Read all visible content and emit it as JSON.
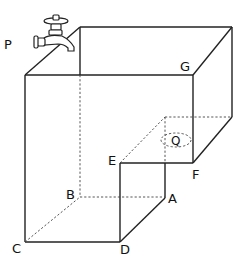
{
  "diagram": {
    "type": "3d-solid-water-tank",
    "colors": {
      "line": "#222222",
      "hidden_line": "#444444",
      "background": "#ffffff"
    },
    "labels": {
      "P": "P",
      "G": "G",
      "Q": "Q",
      "E": "E",
      "F": "F",
      "B": "B",
      "A": "A",
      "C": "C",
      "D": "D"
    },
    "icons": {
      "faucet": "faucet-icon"
    }
  }
}
